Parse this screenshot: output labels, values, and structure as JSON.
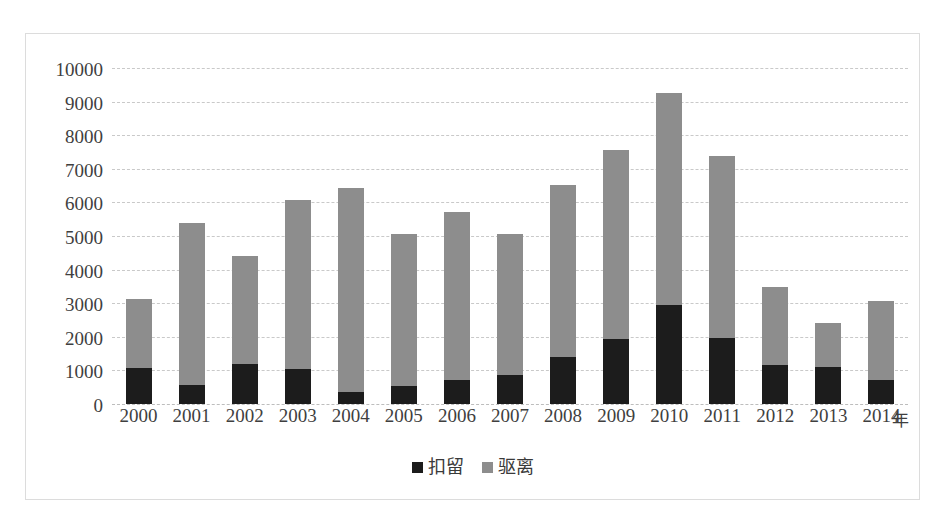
{
  "chart_data": {
    "type": "bar",
    "stacked": true,
    "title": "",
    "subtitle": "",
    "xlabel": "年",
    "ylabel": "",
    "categories": [
      "2000",
      "2001",
      "2002",
      "2003",
      "2004",
      "2005",
      "2006",
      "2007",
      "2008",
      "2009",
      "2010",
      "2011",
      "2012",
      "2013",
      "2014"
    ],
    "series": [
      {
        "name": "扣留",
        "color": "#1c1c1c",
        "values": [
          1080,
          570,
          1200,
          1050,
          370,
          540,
          710,
          860,
          1390,
          1930,
          2950,
          1960,
          1170,
          1090,
          720
        ]
      },
      {
        "name": "驱离",
        "color": "#8d8d8d",
        "values": [
          2040,
          4810,
          3220,
          5020,
          6070,
          4530,
          5000,
          4210,
          5120,
          5630,
          6320,
          5420,
          2310,
          1310,
          2360
        ]
      }
    ],
    "totals": [
      3120,
      5380,
      4420,
      6070,
      6440,
      5070,
      5710,
      5070,
      6510,
      7560,
      9270,
      7380,
      3480,
      2400,
      3080
    ],
    "ylim": [
      0,
      10000
    ],
    "yticks": [
      0,
      1000,
      2000,
      3000,
      4000,
      5000,
      6000,
      7000,
      8000,
      9000,
      10000
    ],
    "ytick_labels": [
      "0",
      "1000",
      "2000",
      "3000",
      "4000",
      "5000",
      "6000",
      "7000",
      "8000",
      "9000",
      "10000"
    ],
    "grid": true,
    "gridline_style": "dashed",
    "gridline_color": "#c9c9c9",
    "legend_position": "bottom",
    "plot_background": "#ffffff",
    "border_color": "#dcdcdc"
  }
}
